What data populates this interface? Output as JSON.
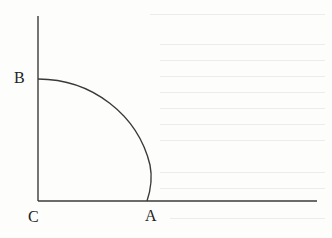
{
  "figure": {
    "type": "geometric-diagram",
    "colors": {
      "stroke": "#3a3a3a",
      "label": "#222222",
      "background": "#fdfdfc"
    },
    "points": {
      "B": {
        "label": "B",
        "x": 38,
        "y": 79
      },
      "C": {
        "label": "C",
        "x": 38,
        "y": 201
      },
      "A": {
        "label": "A",
        "x": 147,
        "y": 201
      }
    },
    "axes": {
      "vertical": {
        "x": 38,
        "y_top": 16,
        "y_bottom": 201
      },
      "horizontal": {
        "y": 201,
        "x_left": 38,
        "x_right": 317
      }
    },
    "arc": {
      "from": "B",
      "to": "A",
      "path": "M38,79 C92,79 138,115 150,165 C153,180 150,192 147,201"
    }
  }
}
